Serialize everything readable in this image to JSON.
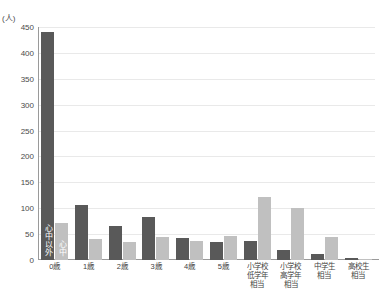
{
  "chart_data": {
    "type": "bar",
    "title": "",
    "subtitle": "",
    "xlabel": "",
    "ylabel": "(人)",
    "unit_label": "(人)",
    "ylim": [
      0,
      450
    ],
    "ytick_step": 50,
    "yticks": [
      "450",
      "400",
      "350",
      "300",
      "250",
      "200",
      "150",
      "100",
      "50",
      "0"
    ],
    "grid": true,
    "legend_position": "in-plot-first-group",
    "categories": [
      "0歳",
      "1歳",
      "2歳",
      "3歳",
      "4歳",
      "5歳",
      "小学校\n低学年\n相当",
      "小学校\n高学年\n相当",
      "中学生\n相当",
      "高校生\n相当"
    ],
    "series": [
      {
        "name": "心中以外",
        "color": "#595959",
        "values": [
          440,
          106,
          66,
          84,
          42,
          35,
          37,
          20,
          12,
          3
        ]
      },
      {
        "name": "心中",
        "color": "#c0c0c0",
        "values": [
          72,
          40,
          35,
          44,
          36,
          47,
          122,
          100,
          44,
          2
        ]
      }
    ],
    "annotations": [
      {
        "text": "心中以外",
        "on_series": 0,
        "on_category": "0歳"
      },
      {
        "text": "心中",
        "on_series": 1,
        "on_category": "0歳"
      }
    ]
  },
  "colors": {
    "series_dark": "#595959",
    "series_light": "#c0c0c0",
    "gridline": "#e9e9e9",
    "axis": "#9a9a9a",
    "text": "#3f3f3f",
    "background": "#ffffff"
  }
}
